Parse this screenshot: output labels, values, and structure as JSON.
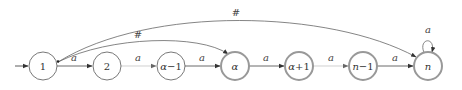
{
  "diagram": {
    "type": "finite-automaton",
    "start_state": "1",
    "states": [
      {
        "id": "s1",
        "label": "1",
        "x": 43,
        "accepting": false
      },
      {
        "id": "s2",
        "label": "2",
        "x": 107,
        "accepting": false
      },
      {
        "id": "s_alpha_minus_1",
        "label": "α−1",
        "x": 171,
        "accepting": false
      },
      {
        "id": "s_alpha",
        "label": "α",
        "x": 235,
        "accepting": true
      },
      {
        "id": "s_alpha_plus_1",
        "label": "α+1",
        "x": 299,
        "accepting": true
      },
      {
        "id": "s_n_minus_1",
        "label": "n−1",
        "x": 363,
        "accepting": true
      },
      {
        "id": "s_n",
        "label": "n",
        "x": 428,
        "accepting": true
      }
    ],
    "transitions": [
      {
        "from": "1",
        "to": "2",
        "label": "a",
        "style": "solid"
      },
      {
        "from": "2",
        "to": "α−1",
        "label": "a",
        "style": "faint"
      },
      {
        "from": "α−1",
        "to": "α",
        "label": "a",
        "style": "solid"
      },
      {
        "from": "α",
        "to": "α+1",
        "label": "a",
        "style": "solid"
      },
      {
        "from": "α+1",
        "to": "n−1",
        "label": "a",
        "style": "faint"
      },
      {
        "from": "n−1",
        "to": "n",
        "label": "a",
        "style": "solid"
      },
      {
        "from": "n",
        "to": "n",
        "label": "a",
        "style": "self-loop"
      },
      {
        "from": "1",
        "to": "α",
        "label": "#",
        "style": "arc-low"
      },
      {
        "from": "1",
        "to": "n",
        "label": "#",
        "style": "arc-high"
      }
    ],
    "edge_labels": {
      "e12": "a",
      "e2am1": "a",
      "eam1a": "a",
      "eaap1": "a",
      "eap1nm1": "a",
      "enm1n": "a",
      "eloop": "a",
      "hash_low": "#",
      "hash_high": "#"
    },
    "node_labels": {
      "n1": "1",
      "n2": "2",
      "nam1_var": "α",
      "nam1_rest": "−1",
      "na": "α",
      "nap1_var": "α",
      "nap1_rest": "+1",
      "nnm1_var": "n",
      "nnm1_rest": "−1",
      "nn": "n"
    },
    "colors": {
      "normal_state_stroke": "#555555",
      "accepting_state_stroke": "#999999",
      "edge_solid": "#444444",
      "edge_faint": "#bbbbbb"
    }
  }
}
